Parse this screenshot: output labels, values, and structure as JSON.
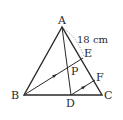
{
  "diagram": {
    "type": "geometry-triangle",
    "points": {
      "A": {
        "label": "A",
        "x": 62,
        "y": 27
      },
      "B": {
        "label": "B",
        "x": 24,
        "y": 95
      },
      "C": {
        "label": "C",
        "x": 102,
        "y": 95
      },
      "D": {
        "label": "D",
        "x": 71,
        "y": 95
      },
      "E": {
        "label": "E",
        "x": 83,
        "y": 58
      },
      "F": {
        "label": "F",
        "x": 95,
        "y": 80
      },
      "P": {
        "label": "P",
        "x": 69,
        "y": 71
      }
    },
    "segments": [
      "AB",
      "BC",
      "CA",
      "AD",
      "BE",
      "DF"
    ],
    "parallel_marks": [
      "BE",
      "DF"
    ],
    "measurement": {
      "segment": "AE",
      "label": "18 cm"
    },
    "colors": {
      "stroke": "#2a2a2a",
      "dashed": "#888888",
      "background": "#ffffff"
    }
  }
}
